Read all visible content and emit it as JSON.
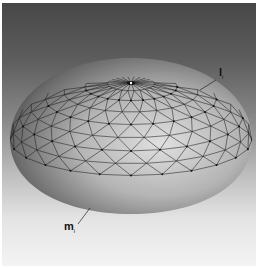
{
  "figure": {
    "labels": [
      {
        "id": "l_i",
        "main": "l",
        "sub": "i"
      },
      {
        "id": "m_i",
        "main": "m",
        "sub": "i"
      }
    ]
  },
  "colors": {
    "background_top": "#474747",
    "background_bottom": "#f3f3f3",
    "mesh_line": "#1e1e1e",
    "dome_light": "#d8d8d8",
    "dome_dark": "#2a2a2a"
  }
}
